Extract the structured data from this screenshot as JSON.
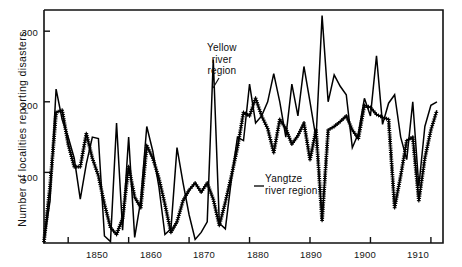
{
  "chart_data": {
    "type": "line",
    "title": "",
    "xlabel": "",
    "ylabel": "Number of localities reporting disasters",
    "xlim": [
      1846,
      1912
    ],
    "ylim": [
      0,
      330
    ],
    "grid": false,
    "legend_position": "inline-annotation",
    "xticks": [
      1850,
      1860,
      1870,
      1880,
      1890,
      1900,
      1910
    ],
    "xtick_labels": [
      "1850",
      "1860",
      "1870",
      "1880",
      "1890",
      "1900",
      "1910"
    ],
    "yticks": [
      100,
      200,
      300
    ],
    "ytick_labels": [
      "100",
      "200",
      "300"
    ],
    "series": [
      {
        "name": "Yellow river region",
        "marker": "none",
        "color": "#000000",
        "x": [
          1846,
          1847,
          1848,
          1849,
          1850,
          1851,
          1852,
          1853,
          1854,
          1855,
          1856,
          1857,
          1858,
          1859,
          1860,
          1861,
          1862,
          1863,
          1864,
          1865,
          1866,
          1867,
          1868,
          1869,
          1870,
          1871,
          1872,
          1873,
          1874,
          1875,
          1876,
          1877,
          1878,
          1879,
          1880,
          1881,
          1882,
          1883,
          1884,
          1885,
          1886,
          1887,
          1888,
          1889,
          1890,
          1891,
          1892,
          1893,
          1894,
          1895,
          1896,
          1897,
          1898,
          1899,
          1900,
          1901,
          1902,
          1903,
          1904,
          1905,
          1906,
          1907,
          1908,
          1909,
          1910,
          1911
        ],
        "y": [
          2,
          60,
          218,
          175,
          150,
          120,
          62,
          112,
          150,
          148,
          10,
          2,
          170,
          18,
          150,
          8,
          60,
          165,
          130,
          80,
          12,
          20,
          135,
          85,
          40,
          5,
          15,
          30,
          260,
          28,
          20,
          90,
          150,
          145,
          225,
          170,
          180,
          200,
          240,
          200,
          150,
          225,
          180,
          250,
          200,
          148,
          322,
          200,
          238,
          222,
          210,
          135,
          155,
          205,
          180,
          265,
          168,
          198,
          210,
          150,
          118,
          200,
          80,
          165,
          195,
          200
        ]
      },
      {
        "name": "Yangtze river region",
        "marker": "plus",
        "color": "#000000",
        "x": [
          1846,
          1847,
          1848,
          1849,
          1850,
          1851,
          1852,
          1853,
          1854,
          1855,
          1856,
          1857,
          1858,
          1859,
          1860,
          1861,
          1862,
          1863,
          1864,
          1865,
          1866,
          1867,
          1868,
          1869,
          1870,
          1871,
          1872,
          1873,
          1874,
          1875,
          1876,
          1877,
          1878,
          1879,
          1880,
          1881,
          1882,
          1883,
          1884,
          1885,
          1886,
          1887,
          1888,
          1889,
          1890,
          1891,
          1892,
          1893,
          1894,
          1895,
          1896,
          1897,
          1898,
          1899,
          1900,
          1901,
          1902,
          1903,
          1904,
          1905,
          1906,
          1907,
          1908,
          1909,
          1910,
          1911
        ],
        "y": [
          2,
          80,
          185,
          188,
          140,
          108,
          108,
          155,
          120,
          95,
          55,
          22,
          12,
          35,
          108,
          65,
          50,
          138,
          120,
          92,
          55,
          15,
          30,
          60,
          75,
          85,
          72,
          85,
          62,
          25,
          58,
          95,
          135,
          185,
          180,
          205,
          180,
          162,
          128,
          175,
          162,
          140,
          152,
          170,
          118,
          160,
          32,
          160,
          165,
          172,
          180,
          160,
          148,
          195,
          192,
          182,
          178,
          175,
          50,
          95,
          145,
          150,
          60,
          120,
          160,
          188
        ]
      }
    ],
    "annotations": [
      {
        "text_line1": "Yellow",
        "text_line2": "river",
        "text_line3": "region",
        "target": "yellow-river-curve"
      },
      {
        "text_line1": "Yangtze",
        "text_line2": "river region",
        "target": "yangtze-river-curve"
      }
    ]
  },
  "axis": {
    "ylabel": "Number of localities reporting disasters"
  },
  "labels": {
    "yellow": {
      "l1": "Yellow",
      "l2": "river",
      "l3": "region"
    },
    "yangtze": {
      "l1": "Yangtze",
      "l2": "river region"
    }
  }
}
